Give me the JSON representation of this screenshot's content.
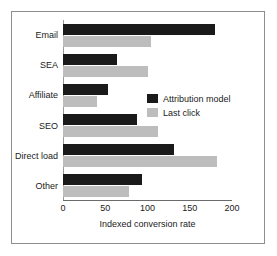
{
  "chart_data": {
    "type": "bar",
    "orientation": "horizontal",
    "title": "",
    "xlabel": "Indexed conversion rate",
    "ylabel": "",
    "xlim": [
      0,
      200
    ],
    "xticks": [
      0,
      50,
      100,
      150,
      200
    ],
    "xtick_labels": [
      "0",
      "50",
      "100",
      "150",
      "200"
    ],
    "grid": false,
    "legend_position": "center-right",
    "categories": [
      "Email",
      "SEA",
      "Affiliate",
      "SEO",
      "Direct load",
      "Other"
    ],
    "series": [
      {
        "name": "Attribution model",
        "color": "#1a1a1a",
        "values": [
          180,
          64,
          53,
          87,
          131,
          94
        ]
      },
      {
        "name": "Last click",
        "color": "#bdbdbd",
        "values": [
          104,
          100,
          40,
          112,
          182,
          78
        ]
      }
    ]
  },
  "legend": {
    "items": [
      {
        "label": "Attribution model",
        "color": "#1a1a1a"
      },
      {
        "label": "Last click",
        "color": "#bdbdbd"
      }
    ]
  },
  "colors": {
    "attribution_model": "#1a1a1a",
    "last_click": "#bdbdbd",
    "axis": "#6b6b6b",
    "frame": "#8e8e8e",
    "background": "#ffffff",
    "text": "#1a1a1a"
  }
}
